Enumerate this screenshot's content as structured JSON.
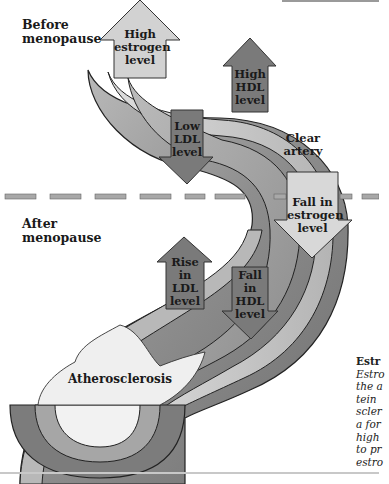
{
  "figure": {
    "phases": {
      "before": "Before menopause",
      "before_line1": "Before",
      "before_line2": "menopause",
      "after_line1": "After",
      "after_line2": "menopause"
    },
    "arrows": [
      {
        "id": "high-estrogen",
        "direction": "up",
        "lines": [
          "High",
          "estrogen",
          "level"
        ],
        "fill": "#d2d2d2"
      },
      {
        "id": "high-hdl",
        "direction": "up",
        "lines": [
          "High",
          "HDL",
          "level"
        ],
        "fill": "#7a7a7a"
      },
      {
        "id": "low-ldl",
        "direction": "down",
        "lines": [
          "Low",
          "LDL",
          "level"
        ],
        "fill": "#7a7a7a"
      },
      {
        "id": "fall-estrogen",
        "direction": "down",
        "lines": [
          "Fall in",
          "estrogen",
          "level"
        ],
        "fill": "#d8d8d8"
      },
      {
        "id": "rise-ldl",
        "direction": "up",
        "lines": [
          "Rise",
          "in",
          "LDL",
          "level"
        ],
        "fill": "#7a7a7a"
      },
      {
        "id": "fall-hdl",
        "direction": "down",
        "lines": [
          "Fall",
          "in",
          "HDL",
          "level"
        ],
        "fill": "#7a7a7a"
      }
    ],
    "labels": {
      "clear_artery_1": "Clear",
      "clear_artery_2": "artery",
      "atherosclerosis": "Atherosclerosis"
    },
    "caption": {
      "title": "Estr",
      "lines": [
        "Estro",
        "the a",
        "tein",
        "scler",
        "a for",
        "high",
        "to pr",
        "estro"
      ]
    },
    "colors": {
      "artery_outer": "#9c9c9c",
      "artery_inner_band": "#c9c9c9",
      "lumen": "#f2f2f2",
      "plaque": "#efefef",
      "dark_arrow": "#7a7a7a",
      "light_arrow": "#d4d4d4",
      "divider": "#a8a8a8"
    }
  }
}
